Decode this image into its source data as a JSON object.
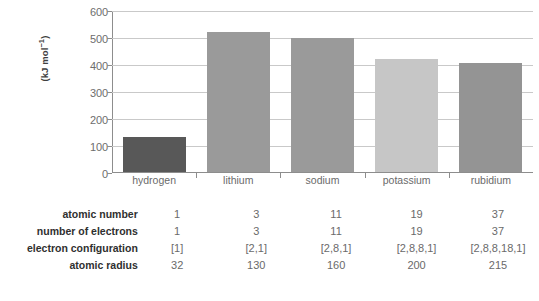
{
  "chart_data": {
    "type": "bar",
    "title": "",
    "xlabel": "",
    "ylabel": "(kJ mol⁻¹)",
    "categories": [
      "hydrogen",
      "lithium",
      "sodium",
      "potassium",
      "rubidium"
    ],
    "values": [
      130,
      520,
      495,
      418,
      403
    ],
    "ylim": [
      0,
      600
    ],
    "yticks": [
      0,
      100,
      200,
      300,
      400,
      500,
      600
    ],
    "ytick_labels": [
      "0",
      "100",
      "200",
      "300",
      "400",
      "500",
      "600"
    ],
    "grid": true,
    "legend": "none",
    "bar_colors": [
      "#585858",
      "#9a9a9a",
      "#9a9a9a",
      "#c6c6c6",
      "#949494"
    ]
  },
  "table": {
    "rows": [
      {
        "label": "atomic number",
        "values": [
          "1",
          "3",
          "11",
          "19",
          "37"
        ]
      },
      {
        "label": "number of electrons",
        "values": [
          "1",
          "3",
          "11",
          "19",
          "37"
        ]
      },
      {
        "label": "electron configuration",
        "values": [
          "[1]",
          "[2,1]",
          "[2,8,1]",
          "[2,8,8,1]",
          "[2,8,8,18,1]"
        ]
      },
      {
        "label": "atomic radius",
        "values": [
          "32",
          "130",
          "160",
          "200",
          "215"
        ]
      }
    ]
  },
  "colors": {
    "gridline": "#c9c9c9",
    "axis": "#8d8d8d",
    "tick_text": "#6d6d6d",
    "header_text": "#2f2f2f",
    "background": "#ffffff"
  }
}
